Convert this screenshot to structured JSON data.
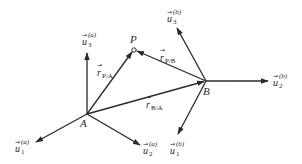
{
  "diagram": {
    "type": "vector-frames",
    "colors": {
      "stroke": "#2a2a2a",
      "background": "#ffffff"
    },
    "points": [
      {
        "id": "A",
        "label": "A",
        "x": 87,
        "y": 114
      },
      {
        "id": "B",
        "label": "B",
        "x": 206,
        "y": 81
      },
      {
        "id": "P",
        "label": "P",
        "x": 134,
        "y": 50
      }
    ],
    "position_vectors": [
      {
        "id": "r_PA",
        "name": "r",
        "subscript": "P/A",
        "from": "A",
        "to": "P"
      },
      {
        "id": "r_PB",
        "name": "r",
        "subscript": "P/B",
        "from": "B",
        "to": "P"
      },
      {
        "id": "r_BA",
        "name": "r",
        "subscript": "B/A",
        "from": "A",
        "to": "B"
      }
    ],
    "frame_a": {
      "origin": "A",
      "axes": [
        {
          "id": "u1a",
          "name": "u",
          "index": "1",
          "superscript": "(a)"
        },
        {
          "id": "u2a",
          "name": "u",
          "index": "2",
          "superscript": "(a)"
        },
        {
          "id": "u3a",
          "name": "u",
          "index": "3",
          "superscript": "(a)"
        }
      ]
    },
    "frame_b": {
      "origin": "B",
      "axes": [
        {
          "id": "u1b",
          "name": "u",
          "index": "1",
          "superscript": "(b)"
        },
        {
          "id": "u2b",
          "name": "u",
          "index": "2",
          "superscript": "(b)"
        },
        {
          "id": "u3b",
          "name": "u",
          "index": "3",
          "superscript": "(b)"
        }
      ]
    },
    "vector_arrow_glyph": "→"
  }
}
